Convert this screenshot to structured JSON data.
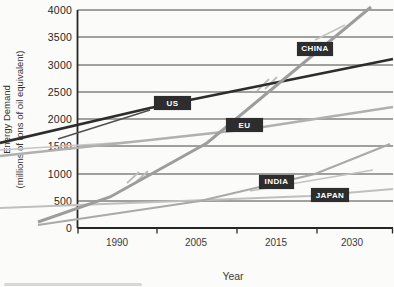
{
  "figure": {
    "x_axis_title": "Year",
    "y_axis_title_line1": "Energy Demand",
    "y_axis_title_line2": "(millions of tons of oil equivalent)",
    "background": "#fbfbf9"
  },
  "chart_data": {
    "type": "line",
    "title": "",
    "xlabel": "Year",
    "ylabel": "Energy Demand (millions of tons of oil equivalent)",
    "x_tick_labels": [
      "1990",
      "2005",
      "2015",
      "2030"
    ],
    "y_ticks": [
      0,
      500,
      1000,
      1500,
      2000,
      2500,
      3000,
      3500,
      4000
    ],
    "ylim": [
      0,
      4000
    ],
    "grid": true,
    "legend_position": "inline-labels-on-lines",
    "categories": [
      1990,
      2005,
      2015,
      2030
    ],
    "series": [
      {
        "name": "US",
        "values": [
          2060,
          2380,
          2670,
          2950
        ],
        "end_value": 3100
      },
      {
        "name": "CHINA",
        "values": [
          640,
          1460,
          2630,
          3770
        ],
        "end_value": 4050
      },
      {
        "name": "EU",
        "values": [
          1550,
          1710,
          1890,
          2100
        ],
        "end_value": 2220
      },
      {
        "name": "INDIA",
        "values": [
          270,
          490,
          830,
          1260
        ],
        "end_value": 1540
      },
      {
        "name": "JAPAN",
        "values": [
          450,
          510,
          560,
          650
        ],
        "end_value": 720
      }
    ]
  },
  "render": {
    "colors": {
      "grid": "#474747",
      "spine": "#262626",
      "tick": "#262626",
      "label_box_bg": "#2d2d2d",
      "label_box_fg": "#ffffff",
      "smudge": "#cbcbc9"
    },
    "plot": {
      "left": 77.5,
      "right": 393,
      "top": 10,
      "bottom": 228
    },
    "gridlines_y": [
      10,
      37,
      65,
      92,
      119,
      146,
      174,
      201
    ],
    "xticks": [
      78,
      157,
      237,
      317,
      392.5
    ],
    "x_tick_label_y": 237,
    "x_tick_labels": [
      {
        "text": "1990",
        "x": 117
      },
      {
        "text": "2005",
        "x": 196
      },
      {
        "text": "2015",
        "x": 276
      },
      {
        "text": "2030",
        "x": 352
      }
    ],
    "y_tick_labels": [
      {
        "text": "4000",
        "y": 10
      },
      {
        "text": "3500",
        "y": 37
      },
      {
        "text": "3000",
        "y": 65
      },
      {
        "text": "2500",
        "y": 92
      },
      {
        "text": "2000",
        "y": 119
      },
      {
        "text": "1500",
        "y": 146
      },
      {
        "text": "1000",
        "y": 174
      },
      {
        "text": "500",
        "y": 201
      },
      {
        "text": "0",
        "y": 228
      }
    ],
    "series_lines": [
      {
        "id": "eu",
        "color": "#b0b0b0",
        "width": 2.4,
        "points": [
          [
            0,
            156
          ],
          [
            150,
            140
          ],
          [
            250,
            129
          ],
          [
            393,
            107
          ]
        ]
      },
      {
        "id": "japan",
        "color": "#bfbfbf",
        "width": 2.2,
        "points": [
          [
            0,
            208
          ],
          [
            310,
            196
          ],
          [
            393,
            189
          ]
        ]
      },
      {
        "id": "india",
        "color": "#a9a9a9",
        "width": 2.1,
        "points": [
          [
            38,
            225
          ],
          [
            200,
            201
          ],
          [
            315,
            174
          ],
          [
            390,
            144
          ]
        ]
      },
      {
        "id": "us",
        "color": "#2d2d2d",
        "width": 2.7,
        "points": [
          [
            0,
            143
          ],
          [
            150,
            108
          ],
          [
            393,
            59
          ]
        ]
      },
      {
        "id": "china",
        "color": "#9d9d9d",
        "width": 3.0,
        "points": [
          [
            38,
            222
          ],
          [
            110,
            197
          ],
          [
            207,
            143
          ],
          [
            371,
            7
          ]
        ]
      }
    ],
    "artifact_strokes": [
      {
        "id": "us-double",
        "color": "#4f4f4f",
        "width": 1.4,
        "points": [
          [
            58,
            139
          ],
          [
            150,
            110
          ]
        ]
      },
      {
        "id": "eu-double",
        "color": "#c6c6c6",
        "width": 1.6,
        "points": [
          [
            0,
            150
          ],
          [
            130,
            142
          ]
        ]
      },
      {
        "id": "india-double",
        "color": "#c3c3c3",
        "width": 1.6,
        "points": [
          [
            250,
            191
          ],
          [
            373,
            170
          ]
        ]
      },
      {
        "id": "china-break-1a",
        "color": "#bdbdbd",
        "width": 1.8,
        "points": [
          [
            127,
            183
          ],
          [
            139,
            172
          ]
        ]
      },
      {
        "id": "china-break-1b",
        "color": "#bdbdbd",
        "width": 1.8,
        "points": [
          [
            136,
            182
          ],
          [
            148,
            171
          ]
        ]
      },
      {
        "id": "china-break-2a",
        "color": "#bdbdbd",
        "width": 1.8,
        "points": [
          [
            257,
            91
          ],
          [
            269,
            79
          ]
        ]
      },
      {
        "id": "china-break-2b",
        "color": "#bdbdbd",
        "width": 1.8,
        "points": [
          [
            265,
            89
          ],
          [
            277,
            77
          ]
        ]
      },
      {
        "id": "china-tip-double",
        "color": "#c3c3c3",
        "width": 1.8,
        "points": [
          [
            315,
            40
          ],
          [
            345,
            25
          ]
        ]
      }
    ],
    "series_labels": [
      {
        "id": "us",
        "text": "US",
        "x": 154,
        "y": 96,
        "w": 37,
        "h": 14
      },
      {
        "id": "china",
        "text": "CHINA",
        "x": 297,
        "y": 42,
        "w": 36,
        "h": 13.5
      },
      {
        "id": "eu",
        "text": "EU",
        "x": 226,
        "y": 118,
        "w": 37,
        "h": 14
      },
      {
        "id": "india",
        "text": "INDIA",
        "x": 259,
        "y": 175,
        "w": 35,
        "h": 13.5
      },
      {
        "id": "japan",
        "text": "JAPAN",
        "x": 311,
        "y": 188,
        "w": 38,
        "h": 14
      }
    ],
    "smudge": {
      "x": 4,
      "y": 283,
      "w": 138,
      "h": 3
    }
  }
}
